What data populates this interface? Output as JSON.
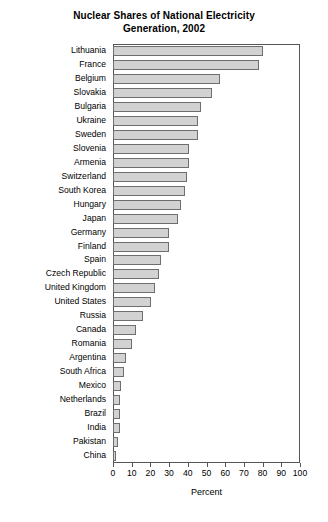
{
  "chart_data": {
    "type": "bar",
    "orientation": "horizontal",
    "title": "Nuclear Shares of National Electricity Generation, 2002",
    "title_lines": [
      "Nuclear Shares of National Electricity",
      "Generation, 2002"
    ],
    "xlabel": "Percent",
    "ylabel": "",
    "xlim": [
      0,
      100
    ],
    "xticks": [
      0,
      10,
      20,
      30,
      40,
      50,
      60,
      70,
      80,
      90,
      100
    ],
    "xtick_labels": [
      "0",
      "10",
      "20",
      "30",
      "40",
      "50",
      "60",
      "70",
      "80",
      "90",
      "100"
    ],
    "grid": false,
    "legend": false,
    "bar_fill_color": "#d2d2d2",
    "bar_edge_color": "#6e6e6e",
    "categories": [
      "Lithuania",
      "France",
      "Belgium",
      "Slovakia",
      "Bulgaria",
      "Ukraine",
      "Sweden",
      "Slovenia",
      "Armenia",
      "Switzerland",
      "South Korea",
      "Hungary",
      "Japan",
      "Germany",
      "Finland",
      "Spain",
      "Czech Republic",
      "United Kingdom",
      "United States",
      "Russia",
      "Canada",
      "Romania",
      "Argentina",
      "South Africa",
      "Mexico",
      "Netherlands",
      "Brazil",
      "India",
      "Pakistan",
      "China"
    ],
    "values": [
      80.1,
      78.0,
      57.3,
      53.2,
      47.3,
      45.7,
      45.7,
      40.7,
      40.5,
      39.5,
      38.6,
      36.1,
      34.5,
      29.9,
      29.8,
      25.8,
      24.5,
      22.4,
      20.3,
      16.0,
      12.3,
      10.3,
      7.2,
      5.9,
      4.1,
      4.0,
      4.0,
      3.7,
      2.5,
      1.4
    ]
  }
}
